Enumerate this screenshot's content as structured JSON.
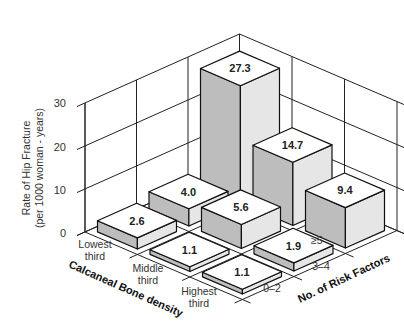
{
  "chart_data": {
    "type": "bar3d",
    "title": "",
    "ylabel": "Rate of Hip Fracture (per 1000 woman - years)",
    "ylabel_lines": [
      "Rate of Hip Fracture",
      "(per 1000 woman - years)"
    ],
    "ylim": [
      0,
      30
    ],
    "yticks": [
      "0",
      "10",
      "20",
      "30"
    ],
    "x_axis": {
      "label": "Calcaneal Bone density",
      "categories": [
        "Lowest third",
        "Middle third",
        "Highest third"
      ],
      "category_lines": [
        [
          "Lowest",
          "third"
        ],
        [
          "Middle",
          "third"
        ],
        [
          "Highest",
          "third"
        ]
      ]
    },
    "z_axis": {
      "label": "No. of Risk Factors",
      "categories": [
        "0–2",
        "3–4",
        "≥5"
      ]
    },
    "series": [
      {
        "name": "0–2",
        "values": [
          2.6,
          1.1,
          1.1
        ]
      },
      {
        "name": "3–4",
        "values": [
          4.0,
          5.6,
          1.9
        ]
      },
      {
        "name": "≥5",
        "values": [
          27.3,
          14.7,
          9.4
        ]
      }
    ],
    "value_labels": [
      "2.6",
      "1.1",
      "1.1",
      "4.0",
      "5.6",
      "1.9",
      "27.3",
      "14.7",
      "9.4"
    ],
    "grid": true,
    "legend": "none",
    "colors": {
      "top": "#ffffff",
      "left_face": "#bdbdbd",
      "right_face": "#e6e6e6",
      "lines": "#111111"
    }
  }
}
